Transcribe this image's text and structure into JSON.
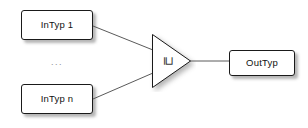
{
  "diagram": {
    "background_color": "#ffffff",
    "node_border_color": "#1a1a1a",
    "edge_color": "#5a5a5a",
    "nodes": {
      "input_first": {
        "label": "InTyp 1"
      },
      "input_last": {
        "label": "InTyp n"
      },
      "output": {
        "label": "OutTyp"
      },
      "operator": {
        "glyph": "⊒",
        "name": "square-superset-or-equal-operator"
      }
    },
    "ellipsis": "...",
    "edges": [
      {
        "from": "InTyp 1",
        "to": "operator"
      },
      {
        "from": "InTyp n",
        "to": "operator"
      },
      {
        "from": "operator",
        "to": "OutTyp"
      }
    ]
  }
}
